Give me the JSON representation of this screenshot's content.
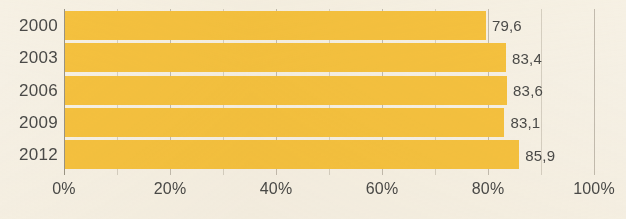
{
  "chart_data": {
    "type": "bar",
    "orientation": "horizontal",
    "title": "",
    "xlabel": "",
    "ylabel": "",
    "categories": [
      "2000",
      "2003",
      "2006",
      "2009",
      "2012"
    ],
    "values": [
      79.6,
      83.4,
      83.6,
      83.1,
      85.9
    ],
    "value_labels": [
      "79,6",
      "83,4",
      "83,6",
      "83,1",
      "85,9"
    ],
    "series": [
      {
        "name": "",
        "values": [
          79.6,
          83.4,
          83.6,
          83.1,
          85.9
        ]
      }
    ],
    "xlim": [
      0,
      100
    ],
    "xticks": [
      0,
      20,
      40,
      60,
      80,
      100
    ],
    "xtick_labels": [
      "0%",
      "20%",
      "40%",
      "60%",
      "80%",
      "100%"
    ],
    "minor_xticks": [
      10,
      30,
      50,
      70,
      90
    ],
    "grid": true,
    "grid_axis": "x",
    "legend": false,
    "legend_position": "none",
    "bar_color": "#f5c23f",
    "text_color": "#4a4a48",
    "background_color": "#f6f1e6",
    "gridline_color": "#b9b2a4",
    "decimal_separator": ","
  },
  "cropped_title_sliver": ""
}
